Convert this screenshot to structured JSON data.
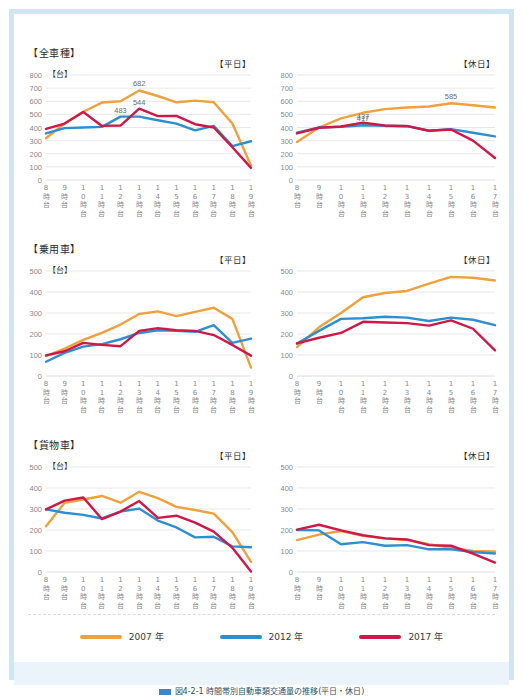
{
  "colors": {
    "y2007": "#f0a03c",
    "y2012": "#2e8fd0",
    "y2017": "#cf1847",
    "frame": "#cfe6f2",
    "grid": "#dedede",
    "axis_text": "#8a8a8a",
    "caption_band": "#eaf4fa"
  },
  "legend": {
    "items": [
      {
        "label": "2007 年",
        "color_key": "y2007"
      },
      {
        "label": "2012 年",
        "color_key": "y2012"
      },
      {
        "label": "2017 年",
        "color_key": "y2017"
      }
    ]
  },
  "caption": {
    "text": "図4-2-1 時間帯別自動車類交通量の推移(平日・休日)"
  },
  "sections": [
    {
      "header": "【全車種】",
      "charts": [
        {
          "daytag": "【平日】",
          "unit": "【台】",
          "chart_data": {
            "type": "line",
            "title": "全車種 平日",
            "xlabel": "",
            "ylabel": "台",
            "ylim": [
              0,
              800
            ],
            "yticks": [
              0,
              100,
              200,
              300,
              400,
              500,
              600,
              700,
              800
            ],
            "categories": [
              "8時台",
              "9時台",
              "10時台",
              "11時台",
              "12時台",
              "13時台",
              "14時台",
              "15時台",
              "16時台",
              "17時台",
              "18時台",
              "19時台"
            ],
            "grid": true,
            "legend_position": "bottom",
            "series": [
              {
                "name": "2007 年",
                "color_key": "y2007",
                "values": [
                  318,
                  430,
                  520,
                  590,
                  600,
                  682,
                  640,
                  592,
                  605,
                  592,
                  430,
                  110
                ]
              },
              {
                "name": "2012 年",
                "color_key": "y2012",
                "values": [
                  355,
                  395,
                  400,
                  405,
                  483,
                  483,
                  455,
                  430,
                  378,
                  412,
                  258,
                  295
                ]
              },
              {
                "name": "2017 年",
                "color_key": "y2017",
                "values": [
                  390,
                  430,
                  518,
                  412,
                  415,
                  544,
                  487,
                  488,
                  425,
                  400,
                  250,
                  92
                ]
              }
            ],
            "annotations": [
              {
                "text": "682",
                "series": "2007 年",
                "category": "13時台",
                "value": 682
              },
              {
                "text": "544",
                "series": "2017 年",
                "category": "13時台",
                "value": 544
              },
              {
                "text": "483",
                "series": "2012 年",
                "category": "12時台",
                "value": 483
              }
            ]
          }
        },
        {
          "daytag": "【休日】",
          "unit": "",
          "chart_data": {
            "type": "line",
            "title": "全車種 休日",
            "xlabel": "",
            "ylabel": "台",
            "ylim": [
              0,
              800
            ],
            "yticks": [
              0,
              100,
              200,
              300,
              400,
              500,
              600,
              700,
              800
            ],
            "categories": [
              "8時台",
              "9時台",
              "10時台",
              "11時台",
              "12時台",
              "13時台",
              "14時台",
              "15時台",
              "16時台",
              "17時台"
            ],
            "grid": true,
            "legend_position": "bottom",
            "series": [
              {
                "name": "2007 年",
                "color_key": "y2007",
                "values": [
                  290,
                  400,
                  470,
                  512,
                  540,
                  552,
                  560,
                  585,
                  570,
                  552
                ]
              },
              {
                "name": "2012 年",
                "color_key": "y2012",
                "values": [
                  360,
                  400,
                  405,
                  417,
                  412,
                  412,
                  375,
                  388,
                  360,
                  332
                ]
              },
              {
                "name": "2017 年",
                "color_key": "y2017",
                "values": [
                  355,
                  398,
                  408,
                  437,
                  415,
                  410,
                  375,
                  385,
                  300,
                  168
                ]
              }
            ],
            "annotations": [
              {
                "text": "585",
                "series": "2007 年",
                "category": "15時台",
                "value": 585
              },
              {
                "text": "437",
                "series": "2017 年",
                "category": "11時台",
                "value": 437
              },
              {
                "text": "417",
                "series": "2012 年",
                "category": "11時台",
                "value": 417
              }
            ]
          }
        }
      ]
    },
    {
      "header": "【乗用車】",
      "charts": [
        {
          "daytag": "【平日】",
          "unit": "【台】",
          "chart_data": {
            "type": "line",
            "title": "乗用車 平日",
            "xlabel": "",
            "ylabel": "台",
            "ylim": [
              0,
              500
            ],
            "yticks": [
              0,
              100,
              200,
              300,
              400,
              500
            ],
            "categories": [
              "8時台",
              "9時台",
              "10時台",
              "11時台",
              "12時台",
              "13時台",
              "14時台",
              "15時台",
              "16時台",
              "17時台",
              "18時台",
              "19時台"
            ],
            "grid": true,
            "legend_position": "bottom",
            "series": [
              {
                "name": "2007 年",
                "color_key": "y2007",
                "values": [
                  95,
                  130,
                  172,
                  205,
                  245,
                  295,
                  308,
                  285,
                  305,
                  325,
                  272,
                  40
                ]
              },
              {
                "name": "2012 年",
                "color_key": "y2012",
                "values": [
                  68,
                  110,
                  140,
                  152,
                  175,
                  205,
                  218,
                  215,
                  210,
                  242,
                  158,
                  178
                ]
              },
              {
                "name": "2017 年",
                "color_key": "y2017",
                "values": [
                  98,
                  118,
                  158,
                  148,
                  142,
                  215,
                  228,
                  218,
                  215,
                  195,
                  148,
                  97
                ]
              }
            ],
            "annotations": []
          }
        },
        {
          "daytag": "【休日】",
          "unit": "",
          "chart_data": {
            "type": "line",
            "title": "乗用車 休日",
            "xlabel": "",
            "ylabel": "台",
            "ylim": [
              0,
              500
            ],
            "yticks": [
              0,
              100,
              200,
              300,
              400,
              500
            ],
            "categories": [
              "8時台",
              "9時台",
              "10時台",
              "11時台",
              "12時台",
              "13時台",
              "14時台",
              "15時台",
              "16時台",
              "17時台"
            ],
            "grid": true,
            "legend_position": "bottom",
            "series": [
              {
                "name": "2007 年",
                "color_key": "y2007",
                "values": [
                  138,
                  232,
                  300,
                  375,
                  395,
                  405,
                  440,
                  472,
                  468,
                  455
                ]
              },
              {
                "name": "2012 年",
                "color_key": "y2012",
                "values": [
                  155,
                  215,
                  272,
                  275,
                  282,
                  278,
                  262,
                  278,
                  268,
                  242
                ]
              },
              {
                "name": "2017 年",
                "color_key": "y2017",
                "values": [
                  155,
                  182,
                  205,
                  258,
                  255,
                  252,
                  240,
                  265,
                  225,
                  122
                ]
              }
            ],
            "annotations": []
          }
        }
      ]
    },
    {
      "header": "【貨物車】",
      "charts": [
        {
          "daytag": "【平日】",
          "unit": "【台】",
          "chart_data": {
            "type": "line",
            "title": "貨物車 平日",
            "xlabel": "",
            "ylabel": "台",
            "ylim": [
              0,
              500
            ],
            "yticks": [
              0,
              100,
              200,
              300,
              400,
              500
            ],
            "categories": [
              "8時台",
              "9時台",
              "10時台",
              "11時台",
              "12時台",
              "13時台",
              "14時台",
              "15時台",
              "16時台",
              "17時台",
              "18時台",
              "19時台"
            ],
            "grid": true,
            "legend_position": "bottom",
            "series": [
              {
                "name": "2007 年",
                "color_key": "y2007",
                "values": [
                  218,
                  330,
                  345,
                  362,
                  330,
                  382,
                  352,
                  310,
                  295,
                  278,
                  190,
                  48
                ]
              },
              {
                "name": "2012 年",
                "color_key": "y2012",
                "values": [
                  298,
                  282,
                  272,
                  255,
                  288,
                  302,
                  245,
                  212,
                  165,
                  168,
                  122,
                  118
                ]
              },
              {
                "name": "2017 年",
                "color_key": "y2017",
                "values": [
                  298,
                  340,
                  355,
                  252,
                  288,
                  338,
                  258,
                  268,
                  235,
                  192,
                  115,
                  2
                ]
              }
            ],
            "annotations": []
          }
        },
        {
          "daytag": "【休日】",
          "unit": "",
          "chart_data": {
            "type": "line",
            "title": "貨物車 休日",
            "xlabel": "",
            "ylabel": "台",
            "ylim": [
              0,
              500
            ],
            "yticks": [
              0,
              100,
              200,
              300,
              400,
              500
            ],
            "categories": [
              "8時台",
              "9時台",
              "10時台",
              "11時台",
              "12時台",
              "13時台",
              "14時台",
              "15時台",
              "16時台",
              "17時台"
            ],
            "grid": true,
            "legend_position": "bottom",
            "series": [
              {
                "name": "2007 年",
                "color_key": "y2007",
                "values": [
                  152,
                  178,
                  195,
                  172,
                  160,
                  152,
                  132,
                  115,
                  100,
                  98
                ]
              },
              {
                "name": "2012 年",
                "color_key": "y2012",
                "values": [
                  200,
                  198,
                  132,
                  142,
                  125,
                  128,
                  108,
                  108,
                  95,
                  88
                ]
              },
              {
                "name": "2017 年",
                "color_key": "y2017",
                "values": [
                  202,
                  225,
                  198,
                  175,
                  160,
                  155,
                  128,
                  125,
                  88,
                  45
                ]
              }
            ],
            "annotations": []
          }
        }
      ]
    }
  ]
}
